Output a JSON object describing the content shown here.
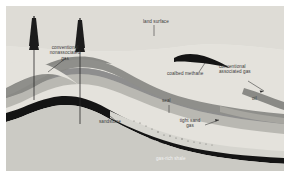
{
  "figure": {
    "kind": "geologic-cross-section",
    "background_color": "#e8e7e2",
    "sky_color": "#dedcd6",
    "label_color": "#3b3b3b",
    "label_color_inverse": "#f2f2f2"
  },
  "labels": {
    "land_surface": "land surface",
    "conventional_nonassociated_gas": "conventional\nnonassociated\ngas",
    "coalbed_methane": "coalbed methane",
    "conventional_associated_gas": "conventional\nassociated gas",
    "seal": "seal",
    "oil": "oil",
    "sandstone": "sandstone",
    "tight_sand_gas": "tight sand\ngas",
    "gas_rich_shale": "gas-rich shale"
  },
  "rigs": [
    {
      "name": "drilling-rig-left",
      "label": "derrick"
    },
    {
      "name": "drilling-rig-right",
      "label": "derrick"
    }
  ],
  "strata": [
    {
      "name": "land-surface-layer",
      "color": "#dedcd6"
    },
    {
      "name": "sandstone-upper-layer",
      "color": "#e2e0da"
    },
    {
      "name": "gas-bearing-sandstone-layer",
      "color": "#8e8e8e"
    },
    {
      "name": "seal-layer",
      "color": "#9a9a96"
    },
    {
      "name": "oil-reservoir-layer",
      "color": "#b9b8b2"
    },
    {
      "name": "tight-sand-layer",
      "color": "#cfcec8"
    },
    {
      "name": "gas-rich-shale-layer",
      "color": "#141414"
    },
    {
      "name": "coalbed-methane-lens",
      "color": "#141414"
    },
    {
      "name": "basement-layer",
      "color": "#c8c7c1"
    }
  ]
}
